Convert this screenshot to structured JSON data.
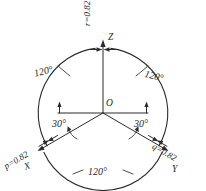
{
  "figure": {
    "background_color": "#ffffff",
    "line_color": "#2b2b2b"
  },
  "origin": {
    "label": "O"
  },
  "axes": [
    {
      "name": "z-axis",
      "label": "Z",
      "coefficient_label": "r=0.82",
      "direction_deg": 90
    },
    {
      "name": "x-axis",
      "label": "X",
      "coefficient_label": "p=0.82",
      "direction_deg": 210
    },
    {
      "name": "y-axis",
      "label": "Y",
      "coefficient_label": "q=0.82",
      "direction_deg": 330
    }
  ],
  "angles": {
    "between_axes": [
      {
        "name": "angle-z-x",
        "label": "120°"
      },
      {
        "name": "angle-z-y",
        "label": "120°"
      },
      {
        "name": "angle-x-y",
        "label": "120°"
      }
    ],
    "to_horizontal": [
      {
        "name": "angle-horizontal-x",
        "label": "30°"
      },
      {
        "name": "angle-horizontal-y",
        "label": "30°"
      }
    ]
  },
  "labels": {
    "z_axis": "Z",
    "x_axis": "X",
    "y_axis": "Y",
    "origin": "O",
    "r_value": "r=0.82",
    "p_value": "p=0.82",
    "q_value": "q=0.82",
    "angle_left_120": "120°",
    "angle_right_120": "120°",
    "angle_bottom_120": "120°",
    "angle_left_30": "30°",
    "angle_right_30": "30°"
  }
}
